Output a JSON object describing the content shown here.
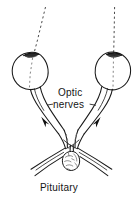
{
  "figure": {
    "style": "black and white line drawing",
    "background_color": "#ffffff",
    "ink_color": "#1a1a1a",
    "width_px": 137,
    "height_px": 201
  },
  "labels": {
    "optic": "Optic",
    "nerves": "nerves",
    "pituitary": "Pituitary"
  },
  "parts": {
    "left_eye": "left eyeball",
    "right_eye": "right eyeball",
    "left_cornea": "left cornea",
    "right_cornea": "right cornea",
    "left_visual_axis": "left visual axis dashed line",
    "right_visual_axis": "right visual axis dashed line",
    "left_optic_nerve": "left optic nerve",
    "right_optic_nerve": "right optic nerve",
    "left_nerve_arrow": "left optic nerve direction arrow",
    "right_nerve_arrow": "right optic nerve direction arrow",
    "optic_chiasm": "optic chiasm crossing",
    "left_optic_tract": "left optic tract",
    "right_optic_tract": "right optic tract",
    "pituitary_gland": "pituitary gland",
    "pituitary_stalk": "pituitary stalk",
    "nerves_leader_left": "left leader dash to nerves label",
    "nerves_leader_right": "right leader dash to nerves label"
  }
}
